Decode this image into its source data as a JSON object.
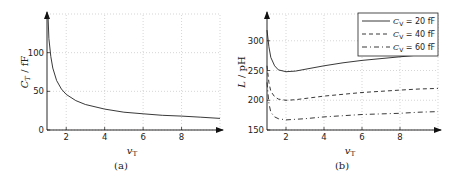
{
  "chart_data": [
    {
      "type": "line",
      "panel": "a",
      "caption": "(a)",
      "xlabel": "v_T",
      "ylabel": "C_T / fF",
      "xlim": [
        1,
        10
      ],
      "ylim": [
        0,
        150
      ],
      "xticks": [
        2,
        4,
        6,
        8
      ],
      "yticks": [
        0,
        50,
        100
      ],
      "grid": true,
      "series": [
        {
          "name": "C_T",
          "style": "solid",
          "x": [
            1.05,
            1.1,
            1.2,
            1.3,
            1.5,
            1.75,
            2,
            2.5,
            3,
            4,
            5,
            6,
            7,
            8,
            9,
            10
          ],
          "y": [
            148,
            118,
            95,
            80,
            64,
            53,
            46,
            38,
            33,
            27,
            23,
            21,
            19,
            18,
            16.5,
            15
          ]
        }
      ]
    },
    {
      "type": "line",
      "panel": "b",
      "caption": "(b)",
      "xlabel": "v_T",
      "ylabel": "L / pH",
      "xlim": [
        1,
        10
      ],
      "ylim": [
        150,
        345
      ],
      "xticks": [
        2,
        4,
        6,
        8
      ],
      "yticks": [
        150,
        200,
        250,
        300
      ],
      "grid": true,
      "legend": "top-right",
      "series": [
        {
          "name": "C_V = 20 fF",
          "style": "solid",
          "x": [
            1.0,
            1.1,
            1.2,
            1.4,
            1.6,
            2,
            2.5,
            3,
            4,
            5,
            6,
            7,
            8,
            9,
            10
          ],
          "y": [
            318,
            290,
            272,
            258,
            251,
            248,
            249,
            252,
            258,
            263,
            267,
            270,
            273,
            276,
            278
          ]
        },
        {
          "name": "C_V = 40 fF",
          "style": "dashed",
          "x": [
            1.0,
            1.1,
            1.2,
            1.4,
            1.6,
            2,
            2.5,
            3,
            4,
            5,
            6,
            7,
            8,
            9,
            10
          ],
          "y": [
            258,
            230,
            215,
            206,
            202,
            200,
            201,
            203,
            207,
            210,
            213,
            215,
            217,
            219,
            220
          ]
        },
        {
          "name": "C_V = 60 fF",
          "style": "dashdot",
          "x": [
            1.0,
            1.1,
            1.2,
            1.4,
            1.6,
            2,
            2.5,
            3,
            4,
            5,
            6,
            7,
            8,
            9,
            10
          ],
          "y": [
            230,
            195,
            180,
            172,
            169,
            167,
            168,
            169,
            172,
            174,
            176,
            177,
            178,
            180,
            181
          ]
        }
      ]
    }
  ],
  "legend": {
    "entries": [
      {
        "sym": "C",
        "sub": "V",
        "text": " = 20 fF"
      },
      {
        "sym": "C",
        "sub": "V",
        "text": " = 40 fF"
      },
      {
        "sym": "C",
        "sub": "V",
        "text": " = 60 fF"
      }
    ]
  },
  "labels": {
    "a_ylabel_main": "C",
    "a_ylabel_sub": "T",
    "a_ylabel_unit": " / fF",
    "a_xlabel_main": "v",
    "a_xlabel_sub": "T",
    "b_ylabel_main": "L",
    "b_ylabel_unit": " / pH",
    "b_xlabel_main": "v",
    "b_xlabel_sub": "T",
    "caption_a": "(a)",
    "caption_b": "(b)"
  }
}
